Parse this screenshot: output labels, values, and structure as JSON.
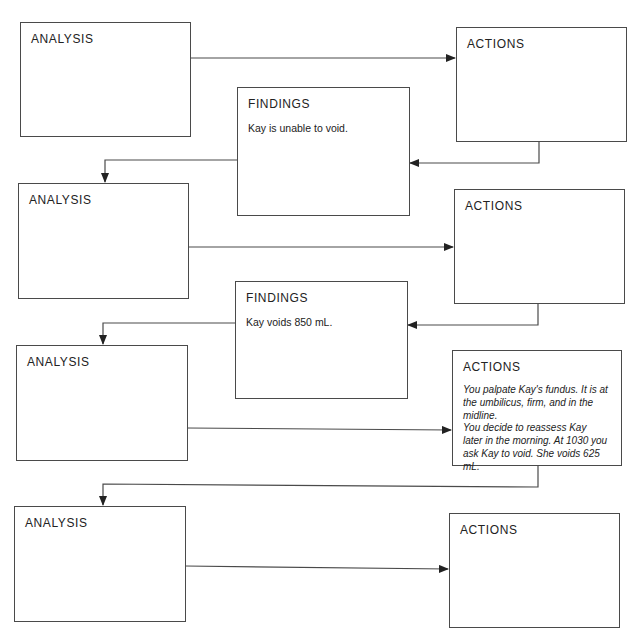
{
  "diagram": {
    "type": "nursing-process-flowchart",
    "rows": [
      {
        "analysis": {
          "title": "ANALYSIS",
          "body": ""
        },
        "actions": {
          "title": "ACTIONS",
          "body": ""
        },
        "findings": {
          "title": "FINDINGS",
          "body": "Kay is unable to void."
        }
      },
      {
        "analysis": {
          "title": "ANALYSIS",
          "body": ""
        },
        "actions": {
          "title": "ACTIONS",
          "body": ""
        },
        "findings": {
          "title": "FINDINGS",
          "body": "Kay voids 850 mL."
        }
      },
      {
        "analysis": {
          "title": "ANALYSIS",
          "body": ""
        },
        "actions": {
          "title": "ACTIONS",
          "body_lines": [
            "You palpate Kay's fundus. It is at",
            "the umbilicus, firm, and in the midline.",
            "You decide to reassess Kay",
            "later in the morning. At 1030 you",
            "ask Kay to void. She voids 625 mL."
          ]
        }
      },
      {
        "analysis": {
          "title": "ANALYSIS",
          "body": ""
        },
        "actions": {
          "title": "ACTIONS",
          "body": ""
        }
      }
    ],
    "colors": {
      "line": "#4a4a4a",
      "text": "#222222",
      "background": "#ffffff"
    }
  }
}
